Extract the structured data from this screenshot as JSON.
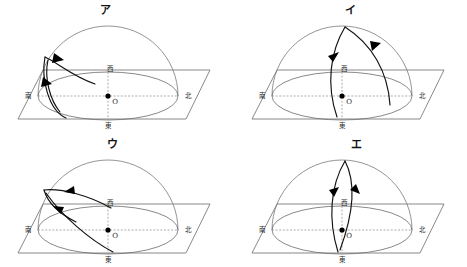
{
  "figure": {
    "title": "",
    "background_color": "#ffffff",
    "line_color": "#6b6b6b",
    "path_color": "#111111",
    "panel_count": 4
  },
  "labels": {
    "origin": "O",
    "south": "南",
    "north": "北",
    "east": "東",
    "west": "西"
  },
  "panels": [
    {
      "id": "panel-a",
      "label": "ア",
      "position": "top-left",
      "directions": {
        "south": "南",
        "north": "北",
        "east": "東",
        "west": "西"
      },
      "origin": "O",
      "path_description": "低い弧：東寄りから南の上空を通る浅い経路、矢印は左上向き"
    },
    {
      "id": "panel-i",
      "label": "イ",
      "position": "top-right",
      "directions": {
        "south": "南",
        "north": "北",
        "east": "東",
        "west": "西"
      },
      "origin": "O",
      "path_description": "天頂付近から南東へ下る傾いた経路、矢印は上向き"
    },
    {
      "id": "panel-u",
      "label": "ウ",
      "position": "bottom-left",
      "directions": {
        "south": "南",
        "north": "北",
        "east": "東",
        "west": "西"
      },
      "origin": "O",
      "path_description": "東から西へ低く横切る浅い経路、矢印は左上向き"
    },
    {
      "id": "panel-e",
      "label": "エ",
      "position": "bottom-right",
      "directions": {
        "south": "南",
        "north": "北",
        "east": "東",
        "west": "西"
      },
      "origin": "O",
      "path_description": "天頂を通る細い縦の経路、左は上向き矢印・右は下向き矢印"
    }
  ]
}
